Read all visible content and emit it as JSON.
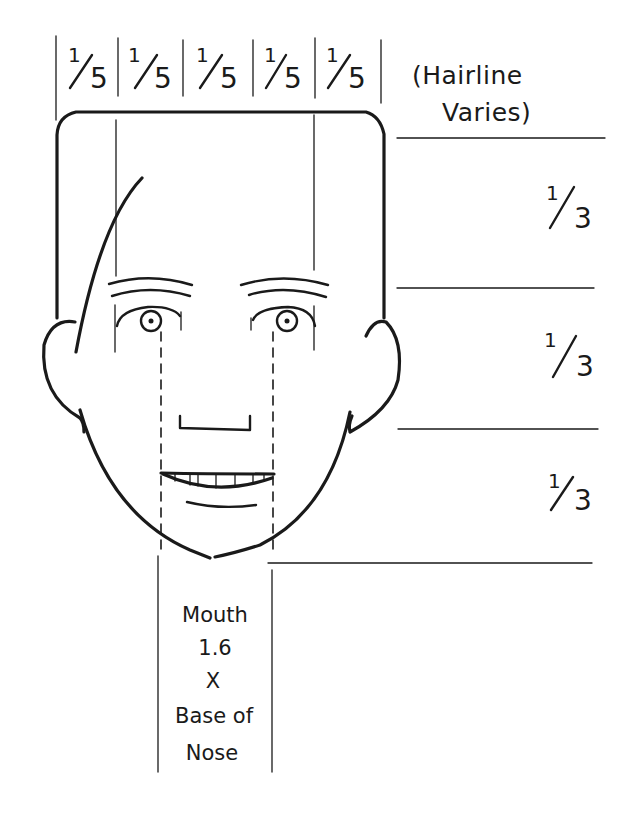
{
  "width_divisions": {
    "count": 5,
    "labels": [
      {
        "numerator": "1",
        "denominator": "5"
      },
      {
        "numerator": "1",
        "denominator": "5"
      },
      {
        "numerator": "1",
        "denominator": "5"
      },
      {
        "numerator": "1",
        "denominator": "5"
      },
      {
        "numerator": "1",
        "denominator": "5"
      }
    ]
  },
  "hairline_note": {
    "line1": "(Hairline",
    "line2": "Varies)"
  },
  "height_divisions": {
    "count": 3,
    "labels": [
      {
        "numerator": "1",
        "denominator": "3"
      },
      {
        "numerator": "1",
        "denominator": "3"
      },
      {
        "numerator": "1",
        "denominator": "3"
      }
    ]
  },
  "mouth_note": {
    "lines": [
      "Mouth",
      "1.6",
      "X",
      "Base of",
      "Nose"
    ]
  },
  "colors": {
    "ink": "#1a1a1a",
    "background": "#ffffff"
  }
}
